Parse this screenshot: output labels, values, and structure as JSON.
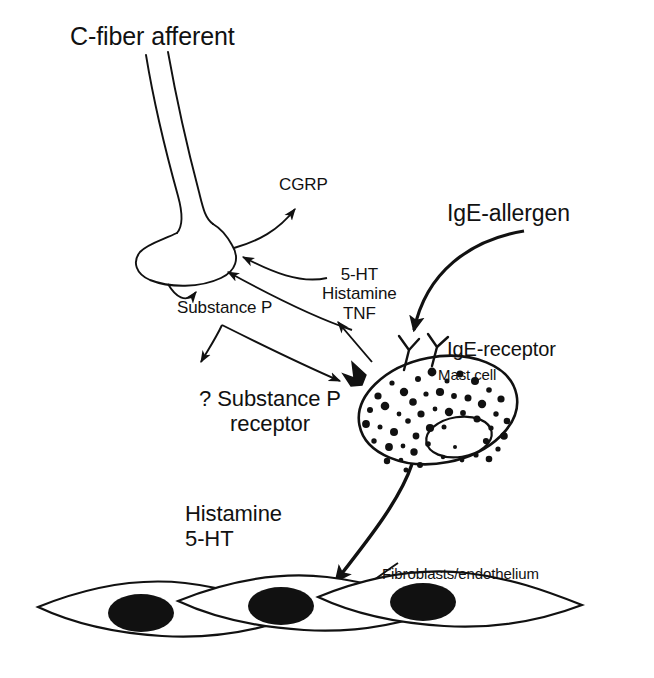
{
  "figure": {
    "background_color": "#ffffff",
    "ink_color": "#111111"
  },
  "labels": {
    "c_fiber": "C-fiber afferent",
    "cgrp": "CGRP",
    "mediators": "5-HT\nHistamine\nTNF",
    "substance_p": "Substance P",
    "ige_allergen": "IgE-allergen",
    "ige_receptor": "IgE-receptor",
    "mast_cell": "Mast cell",
    "sp_receptor": "? Substance P\nreceptor",
    "release": "Histamine\n5-HT",
    "fibroblasts": "Fibroblasts/endothelium"
  },
  "structures": {
    "nerve_terminal": "c-fiber-nerve-terminal-bulb",
    "mast_cell": "granulated-mast-cell-with-nucleus",
    "ige_receptors": "two-y-shaped-ige-receptors",
    "sp_receptor_site": "filled-triangular-substance-p-receptor",
    "fibroblast_cells": "three-spindle-shaped-cells-with-nuclei"
  },
  "arrows": [
    {
      "name": "terminal-to-cgrp",
      "from": "nerve-terminal",
      "to": "CGRP",
      "style": "thin-curved"
    },
    {
      "name": "mediators-to-terminal",
      "from": "5-HT/Histamine/TNF",
      "to": "nerve-terminal",
      "style": "thin-curved"
    },
    {
      "name": "mastcell-to-terminal",
      "from": "mast-cell",
      "to": "nerve-terminal",
      "style": "thin-curved"
    },
    {
      "name": "terminal-to-substance-p",
      "from": "nerve-terminal",
      "to": "Substance P",
      "style": "thin-curved"
    },
    {
      "name": "substance-p-to-receptor",
      "from": "Substance P",
      "to": "sp-receptor",
      "style": "thin-curved"
    },
    {
      "name": "mastcell-to-mediators",
      "from": "mast-cell",
      "to": "5-HT/Histamine/TNF",
      "style": "thin-straight"
    },
    {
      "name": "ige-allergen-to-receptor",
      "from": "IgE-allergen",
      "to": "IgE-receptor",
      "style": "thick-curved"
    },
    {
      "name": "mastcell-to-fibroblasts",
      "from": "mast-cell",
      "to": "fibroblasts",
      "style": "thick-curved"
    },
    {
      "name": "fibroblast-pointer",
      "from": "Fibroblasts/endothelium",
      "to": "fibroblast-cell",
      "style": "thin-straight"
    }
  ]
}
